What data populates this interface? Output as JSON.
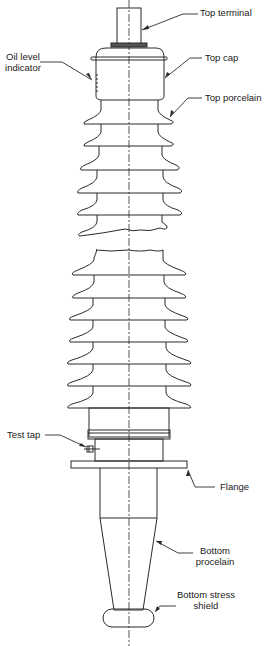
{
  "diagram": {
    "colors": {
      "line": "#2b2b2b",
      "background": "#ffffff"
    },
    "labels": {
      "top_terminal": "Top terminal",
      "oil_level_indicator_1": "Oil level",
      "oil_level_indicator_2": "indicator",
      "top_cap": "Top cap",
      "top_porcelain": "Top porcelain",
      "test_tap": "Test tap",
      "flange": "Flange",
      "bottom_porcelain_1": "Bottom",
      "bottom_porcelain_2": "procelain",
      "bottom_stress_shield_1": "Bottom stress",
      "bottom_stress_shield_2": "shield"
    }
  }
}
